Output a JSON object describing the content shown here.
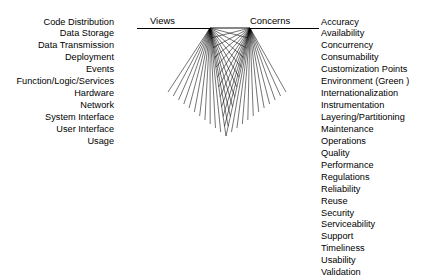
{
  "diagram": {
    "title_left": "Views",
    "title_right": "Concerns",
    "views": [
      "Code Distribution",
      "Data Storage",
      "Data Transmission",
      "Deployment",
      "Events",
      "Function/Logic/Services",
      "Hardware",
      "Network",
      "System Interface",
      "User Interface",
      "Usage"
    ],
    "concerns": [
      "Accuracy",
      "Availability",
      "Concurrency",
      "Consumability",
      "Customization Points",
      "Environment (Green )",
      "Internationalization",
      "Instrumentation",
      "Layering/Partitioning",
      "Maintenance",
      "Operations",
      "Quality",
      "Performance",
      "Regulations",
      "Reliability",
      "Reuse",
      "Security",
      "Serviceability",
      "Support",
      "Timeliness",
      "Usability",
      "Validation"
    ],
    "colors": {
      "line": "#000000",
      "text": "#000000",
      "background": "#ffffff"
    },
    "mesh": {
      "left_apex": [
        210,
        28
      ],
      "right_apex": [
        250,
        28
      ],
      "bottom_tip": [
        226,
        136
      ],
      "left_fan_lines": 23,
      "right_fan_lines": 23
    }
  }
}
